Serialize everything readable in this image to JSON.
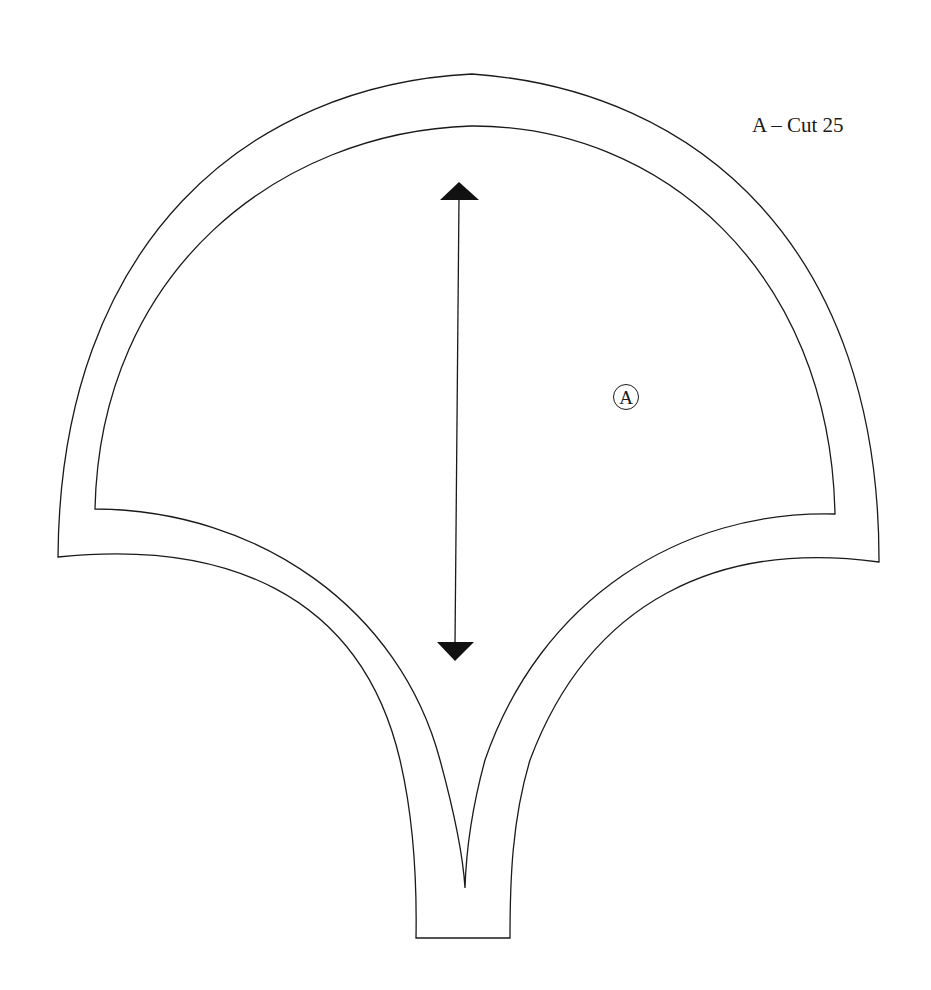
{
  "pattern": {
    "title": "A – Cut 25",
    "piece_letter": "A",
    "grainline": "double-headed arrow",
    "outlines": [
      "cutting line (outer, includes seam allowance)",
      "sewing line (inner)"
    ]
  },
  "colors": {
    "background": "#ffffff",
    "line": "#1a1a1a"
  }
}
